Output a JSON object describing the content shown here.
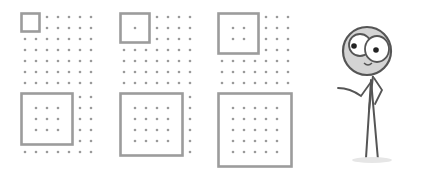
{
  "diagram": {
    "colors": {
      "dot": "#9a9a9a",
      "square": "#9c9c9c",
      "figure_line": "#555555",
      "head_fill": "#d4d4d4",
      "eye_fill": "#ffffff",
      "pupil": "#222222"
    },
    "grid": {
      "columns": 7,
      "rows": 7,
      "spacing": 11
    },
    "panels": [
      {
        "origin": [
          25,
          17
        ],
        "square_size": 1
      },
      {
        "origin": [
          124,
          17
        ],
        "square_size": 2
      },
      {
        "origin": [
          222,
          17
        ],
        "square_size": 3
      },
      {
        "origin": [
          25,
          97
        ],
        "square_size": 4,
        "rows": 6
      },
      {
        "origin": [
          124,
          97
        ],
        "square_size": 5,
        "rows": 6
      },
      {
        "origin": [
          222,
          97
        ],
        "square_size": 6,
        "rows": 6
      }
    ],
    "figure": {
      "name": "stick-figure",
      "pose": "pointing-left"
    }
  }
}
